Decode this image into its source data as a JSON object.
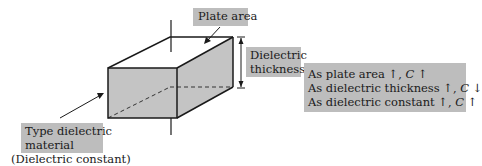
{
  "diagram": {
    "colors": {
      "label_fill": "#bdbdbd",
      "face_fill": "#c4c4c4",
      "line": "#1a1a1a"
    },
    "labels": {
      "plate_area": "Plate area",
      "dielectric_thickness_line1": "Dielectric",
      "dielectric_thickness_line2": "thickness",
      "type_dielectric_line1": "Type dielectric",
      "type_dielectric_line2": "material",
      "dielectric_constant_note": "(Dielectric constant)"
    },
    "relationships": [
      {
        "text": "As plate area",
        "arrow": "↑",
        "symbol": "C",
        "result": "↑"
      },
      {
        "text": "As dielectric thickness",
        "arrow": "↑",
        "symbol": "C",
        "result": "↓"
      },
      {
        "text": "As dielectric constant",
        "arrow": "↑",
        "symbol": "C",
        "result": "↑"
      }
    ]
  }
}
